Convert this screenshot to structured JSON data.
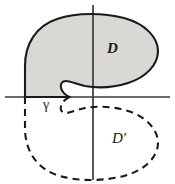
{
  "figure": {
    "labels": {
      "domain_upper": "D",
      "domain_lower": "D′",
      "boundary_arc": "γ"
    },
    "colors": {
      "fill": "#d9d8d5",
      "stroke": "#1a1a1a",
      "axis": "#3a3a3a",
      "background": "#ffffff",
      "label": "#1a1a1a"
    },
    "axes": {
      "horizontal": {
        "name": "real-axis",
        "y": 97,
        "x_start": 5,
        "x_end": 170,
        "style": "solid"
      },
      "vertical": {
        "name": "imaginary-axis",
        "x": 93,
        "y_start": 5,
        "y_end": 180,
        "style": "solid"
      }
    },
    "regions": [
      {
        "name": "upper-region",
        "label": "D",
        "boundary_style": "solid",
        "filled": true,
        "path": "M 25 97 L 25 66 C 25 44 36 26 57 19 C 78 12 104 13 124 18 C 146 24 158 38 158 51 C 158 64 147 77 128 83 C 112 88 96 88 85 86 C 76 84 70 81 66 81 C 62 81 60 84 61 88 C 62 92 66 96 70 97 Z"
      },
      {
        "name": "lower-region",
        "label": "D′",
        "boundary_style": "dashed",
        "filled": false,
        "path": "M 25 97 L 25 128 C 25 150 36 168 57 175 C 78 182 104 181 124 176 C 146 170 158 156 158 143 C 158 130 147 117 128 111 C 112 106 96 106 85 108 C 76 110 70 113 66 113 C 62 113 60 110 61 106 C 62 102 66 98 70 97 Z"
      }
    ],
    "arc": {
      "name": "gamma-arc",
      "label": "γ",
      "lies_on": "real-axis",
      "from_x": 25,
      "to_x": 70,
      "y": 97
    }
  }
}
